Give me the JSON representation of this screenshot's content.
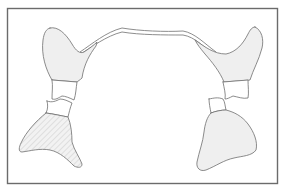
{
  "figure": {
    "title": "",
    "colors": {
      "outline": "#6e6e6e",
      "fill": "#efefef",
      "frame": "#6b6b6b",
      "hatch": "#d9d9d9",
      "background": "#ffffff"
    },
    "parts": [
      {
        "id": "connecting-band",
        "label": ""
      },
      {
        "id": "left-upper-lobe",
        "label": ""
      },
      {
        "id": "right-upper-lobe",
        "label": ""
      },
      {
        "id": "left-upper-segment",
        "label": ""
      },
      {
        "id": "left-lower-segment",
        "label": ""
      },
      {
        "id": "right-upper-segment",
        "label": ""
      },
      {
        "id": "right-lower-segment",
        "label": ""
      },
      {
        "id": "left-lower-lobe",
        "label": "",
        "pattern": "hatched"
      },
      {
        "id": "right-lower-lobe",
        "label": "",
        "pattern": "plain"
      }
    ]
  }
}
